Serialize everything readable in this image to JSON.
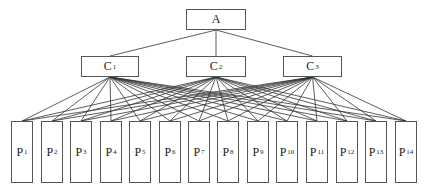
{
  "diagram": {
    "type": "hierarchy",
    "line_color": "#333333",
    "border_color": "#555555",
    "root": {
      "id": "A",
      "label": "A",
      "sub": "",
      "x": 186,
      "y": 9,
      "w": 60,
      "h": 21
    },
    "criteria": [
      {
        "id": "C1",
        "label": "C",
        "sub": "1",
        "x": 81,
        "y": 56,
        "w": 58,
        "h": 21
      },
      {
        "id": "C2",
        "label": "C",
        "sub": "2",
        "x": 186,
        "y": 56,
        "w": 60,
        "h": 21
      },
      {
        "id": "C3",
        "label": "C",
        "sub": "3",
        "x": 283,
        "y": 56,
        "w": 59,
        "h": 21
      }
    ],
    "alternatives": [
      {
        "id": "P1",
        "label": "P",
        "sub": "1",
        "x": 11,
        "y": 121,
        "w": 22,
        "h": 62
      },
      {
        "id": "P2",
        "label": "P",
        "sub": "2",
        "x": 41,
        "y": 121,
        "w": 22,
        "h": 62
      },
      {
        "id": "P3",
        "label": "P",
        "sub": "3",
        "x": 70,
        "y": 121,
        "w": 22,
        "h": 62
      },
      {
        "id": "P4",
        "label": "P",
        "sub": "4",
        "x": 100,
        "y": 121,
        "w": 22,
        "h": 62
      },
      {
        "id": "P5",
        "label": "P",
        "sub": "5",
        "x": 129,
        "y": 121,
        "w": 22,
        "h": 62
      },
      {
        "id": "P6",
        "label": "P",
        "sub": "6",
        "x": 159,
        "y": 121,
        "w": 22,
        "h": 62
      },
      {
        "id": "P7",
        "label": "P",
        "sub": "7",
        "x": 188,
        "y": 121,
        "w": 22,
        "h": 62
      },
      {
        "id": "P8",
        "label": "P",
        "sub": "8",
        "x": 217,
        "y": 121,
        "w": 22,
        "h": 62
      },
      {
        "id": "P9",
        "label": "P",
        "sub": "9",
        "x": 247,
        "y": 121,
        "w": 22,
        "h": 62
      },
      {
        "id": "P10",
        "label": "P",
        "sub": "10",
        "x": 276,
        "y": 121,
        "w": 22,
        "h": 62
      },
      {
        "id": "P11",
        "label": "P",
        "sub": "11",
        "x": 306,
        "y": 121,
        "w": 22,
        "h": 62
      },
      {
        "id": "P12",
        "label": "P",
        "sub": "12",
        "x": 336,
        "y": 121,
        "w": 22,
        "h": 62
      },
      {
        "id": "P13",
        "label": "P",
        "sub": "13",
        "x": 365,
        "y": 121,
        "w": 22,
        "h": 62
      },
      {
        "id": "P14",
        "label": "P",
        "sub": "14",
        "x": 395,
        "y": 121,
        "w": 22,
        "h": 62
      }
    ],
    "edges": "root connects to every criterion; every criterion connects to every alternative"
  }
}
